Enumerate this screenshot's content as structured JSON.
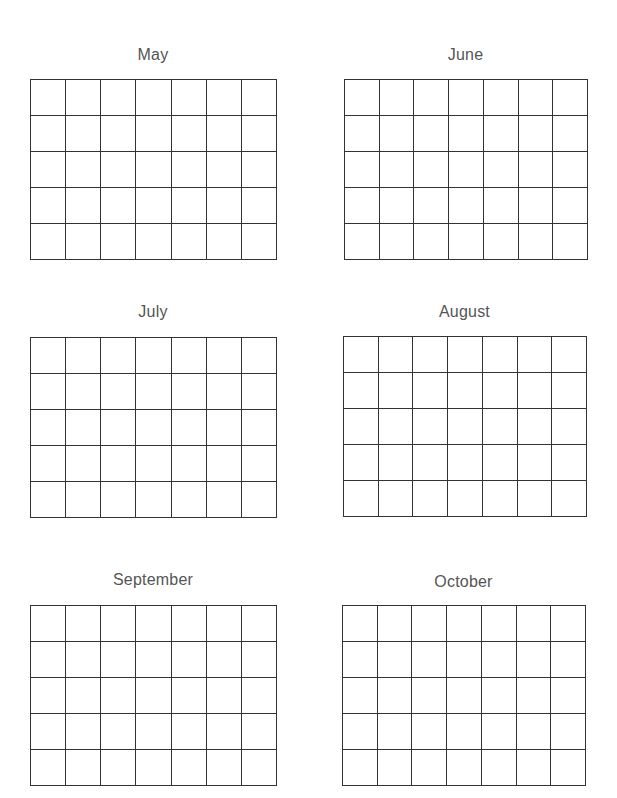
{
  "months": [
    {
      "name": "May"
    },
    {
      "name": "June"
    },
    {
      "name": "July"
    },
    {
      "name": "August"
    },
    {
      "name": "September"
    },
    {
      "name": "October"
    }
  ],
  "grid": {
    "rows": 5,
    "columns": 7,
    "line_color": "#333333",
    "title_color": "#555555"
  }
}
